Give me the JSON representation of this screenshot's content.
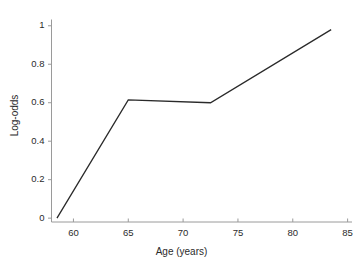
{
  "chart_data": {
    "type": "line",
    "title": "",
    "xlabel": "Age (years)",
    "ylabel": "Log-odds",
    "xlim": [
      58.0,
      85.4
    ],
    "ylim": [
      -0.02,
      1.03
    ],
    "xticks": [
      60,
      65,
      70,
      75,
      80,
      85
    ],
    "xtick_labels": [
      "60",
      "65",
      "70",
      "75",
      "80",
      "85"
    ],
    "yticks": [
      0,
      0.2,
      0.4,
      0.6,
      0.8,
      1
    ],
    "ytick_labels": [
      "0",
      "0.2",
      "0.4",
      "0.6",
      "0.8",
      "1"
    ],
    "grid": false,
    "legend": null,
    "spines": [
      "left",
      "bottom"
    ],
    "tick_direction": {
      "x": "in",
      "y": "out"
    },
    "series": [
      {
        "name": "log-odds",
        "color": "#2a2a2a",
        "line_width": 1.3,
        "x": [
          58.5,
          65.0,
          72.5,
          83.5
        ],
        "y": [
          0.0,
          0.615,
          0.6,
          0.98
        ]
      }
    ]
  }
}
